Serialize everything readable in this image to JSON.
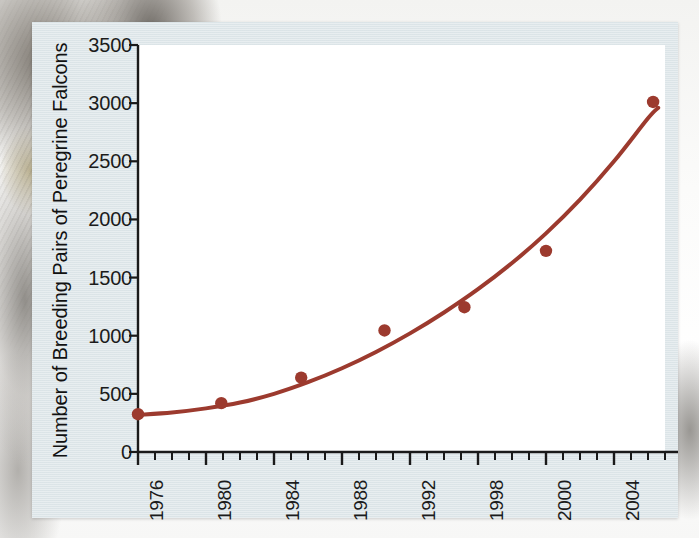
{
  "figure": {
    "panel_background": "#dfe7ea",
    "plot_background": "#ffffff",
    "axis_color": "#1a1a1a",
    "series_color": "#9c3a2e"
  },
  "chart_data": {
    "type": "scatter",
    "title": "",
    "xlabel": "",
    "ylabel": "Number of Breeding Pairs of Peregrine Falcons",
    "xlim": [
      1976,
      2007
    ],
    "ylim": [
      0,
      3500
    ],
    "grid": false,
    "legend": null,
    "x_tick_labels": [
      "1976",
      "1980",
      "1984",
      "1988",
      "1992",
      "1998",
      "2000",
      "2004"
    ],
    "x_tick_values": [
      1976,
      1980,
      1984,
      1988,
      1992,
      1996,
      2000,
      2004
    ],
    "y_tick_labels": [
      "0",
      "500",
      "1000",
      "1500",
      "2000",
      "2500",
      "3000",
      "3500"
    ],
    "y_tick_values": [
      0,
      500,
      1000,
      1500,
      2000,
      2500,
      3000,
      3500
    ],
    "x_minor_tick_interval": 1,
    "points": [
      {
        "x": 1976.0,
        "y": 325
      },
      {
        "x": 1980.9,
        "y": 420
      },
      {
        "x": 1985.6,
        "y": 640
      },
      {
        "x": 1990.5,
        "y": 1045
      },
      {
        "x": 1995.2,
        "y": 1245
      },
      {
        "x": 2000.0,
        "y": 1730
      },
      {
        "x": 2006.3,
        "y": 3010
      }
    ],
    "fit_curve": {
      "description": "smooth exponential-style trend curve through the data",
      "points": [
        {
          "x": 1976.0,
          "y": 320
        },
        {
          "x": 1978.0,
          "y": 340
        },
        {
          "x": 1980.0,
          "y": 375
        },
        {
          "x": 1982.0,
          "y": 425
        },
        {
          "x": 1984.0,
          "y": 500
        },
        {
          "x": 1986.0,
          "y": 600
        },
        {
          "x": 1988.0,
          "y": 720
        },
        {
          "x": 1990.0,
          "y": 860
        },
        {
          "x": 1992.0,
          "y": 1020
        },
        {
          "x": 1994.0,
          "y": 1200
        },
        {
          "x": 1996.0,
          "y": 1400
        },
        {
          "x": 1998.0,
          "y": 1625
        },
        {
          "x": 2000.0,
          "y": 1880
        },
        {
          "x": 2002.0,
          "y": 2170
        },
        {
          "x": 2004.0,
          "y": 2500
        },
        {
          "x": 2006.0,
          "y": 2870
        },
        {
          "x": 2006.6,
          "y": 2960
        }
      ]
    }
  }
}
